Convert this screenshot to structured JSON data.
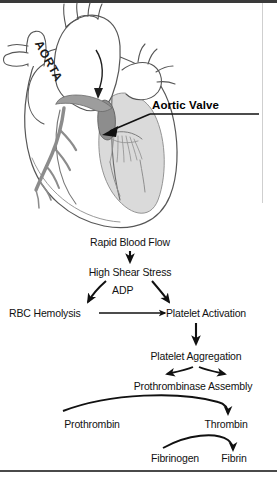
{
  "figure": {
    "anatomy": {
      "aorta_label": "AORTA",
      "callout_label": "Aortic Valve",
      "colors": {
        "outline": "#4f4f4f",
        "chamber_fill": "#d8d8d8",
        "vessel_fill": "#9a9a9a",
        "valve_fill": "#8e8e8e",
        "background": "#ffffff"
      }
    },
    "flowchart": {
      "type": "diagram",
      "nodes": [
        {
          "id": "rapid-blood-flow",
          "label": "Rapid Blood Flow",
          "x": 130,
          "y": 240
        },
        {
          "id": "high-shear-stress",
          "label": "High Shear Stress",
          "x": 130,
          "y": 270
        },
        {
          "id": "adp",
          "label": "ADP",
          "x": 122,
          "y": 290
        },
        {
          "id": "rbc-hemolysis",
          "label": "RBC Hemolysis",
          "x": 55,
          "y": 312
        },
        {
          "id": "platelet-activation",
          "label": "Platelet Activation",
          "x": 196,
          "y": 312
        },
        {
          "id": "platelet-aggregation",
          "label": "Platelet Aggregation",
          "x": 196,
          "y": 355
        },
        {
          "id": "prothrombinase-assembly",
          "label": "Prothrombinase Assembly",
          "x": 193,
          "y": 385
        },
        {
          "id": "prothrombin",
          "label": "Prothrombin",
          "x": 92,
          "y": 424
        },
        {
          "id": "thrombin",
          "label": "Thrombin",
          "x": 223,
          "y": 424
        },
        {
          "id": "fibrinogen",
          "label": "Fibrinogen",
          "x": 173,
          "y": 458
        },
        {
          "id": "fibrin",
          "label": "Fibrin",
          "x": 232,
          "y": 458
        }
      ],
      "edges": [
        {
          "from": "rapid-blood-flow",
          "to": "high-shear-stress",
          "style": "straight-down"
        },
        {
          "from": "high-shear-stress",
          "to": "rbc-hemolysis",
          "style": "curve-left"
        },
        {
          "from": "high-shear-stress",
          "to": "platelet-activation",
          "style": "curve-right"
        },
        {
          "from": "rbc-hemolysis",
          "to": "platelet-activation",
          "style": "straight-right"
        },
        {
          "from": "platelet-activation",
          "to": "platelet-aggregation",
          "style": "straight-down"
        },
        {
          "from": "platelet-aggregation",
          "to": "prothrombinase-assembly",
          "style": "split-both"
        },
        {
          "from": "prothrombin",
          "to": "thrombin",
          "style": "sweep-curve"
        },
        {
          "from": "fibrinogen",
          "to": "fibrin",
          "style": "sweep-curve"
        }
      ]
    }
  }
}
